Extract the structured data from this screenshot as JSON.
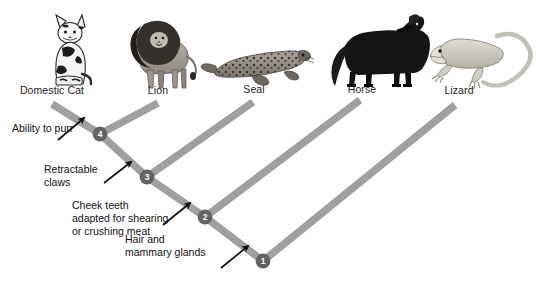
{
  "figure": {
    "type": "cladogram",
    "title": "",
    "background_color": "#ffffff",
    "branch_color": "#a0a0a0",
    "node_color": "#636363",
    "node_label_color": "#ffffff",
    "text_color": "#1a1a1a"
  },
  "taxa": [
    {
      "label": "Domestic Cat",
      "icon": "domestic-cat-illustration",
      "label_x": 10,
      "label_y": 84,
      "label_w": 84,
      "tip_x": 52,
      "tip_y": 104
    },
    {
      "label": "Lion",
      "icon": "lion-illustration",
      "label_x": 124,
      "label_y": 84,
      "label_w": 68,
      "tip_x": 158,
      "tip_y": 103
    },
    {
      "label": "Seal",
      "icon": "seal-illustration",
      "label_x": 225,
      "label_y": 83,
      "label_w": 58,
      "tip_x": 253,
      "tip_y": 102
    },
    {
      "label": "Horse",
      "icon": "horse-illustration",
      "label_x": 332,
      "label_y": 83,
      "label_w": 60,
      "tip_x": 360,
      "tip_y": 100
    },
    {
      "label": "Lizard",
      "icon": "lizard-illustration",
      "label_x": 428,
      "label_y": 84,
      "label_w": 62,
      "tip_x": 455,
      "tip_y": 105
    }
  ],
  "nodes": [
    {
      "id": "1",
      "x": 263,
      "y": 261,
      "trait": "Hair and mammary glands"
    },
    {
      "id": "2",
      "x": 205,
      "y": 217,
      "trait": "Cheek teeth adapted for shearing or crushing meat"
    },
    {
      "id": "3",
      "x": 147,
      "y": 177,
      "trait": "Retractable claws"
    },
    {
      "id": "4",
      "x": 100,
      "y": 134,
      "trait": "Ability to purr"
    }
  ],
  "branches": [
    {
      "from": "tip-domestic-cat",
      "to": "node-4"
    },
    {
      "from": "tip-lion",
      "to": "node-4"
    },
    {
      "from": "node-4",
      "to": "node-3"
    },
    {
      "from": "tip-seal",
      "to": "node-3"
    },
    {
      "from": "node-3",
      "to": "node-2"
    },
    {
      "from": "tip-horse",
      "to": "node-2"
    },
    {
      "from": "node-2",
      "to": "node-1"
    },
    {
      "from": "tip-lizard",
      "to": "node-1"
    }
  ],
  "annotations": [
    {
      "id": "ability-to-purr",
      "lines": [
        "Ability to purr"
      ],
      "x": 12,
      "y": 122,
      "align": "left",
      "arrow": {
        "x1": 58,
        "y1": 140,
        "x2": 84,
        "y2": 118
      }
    },
    {
      "id": "retractable-claws",
      "lines": [
        "Retractable",
        "claws"
      ],
      "x": 44,
      "y": 163,
      "align": "left",
      "arrow": {
        "x1": 104,
        "y1": 183,
        "x2": 131,
        "y2": 162
      }
    },
    {
      "id": "cheek-teeth",
      "lines": [
        "Cheek teeth",
        "adapted for shearing",
        "or crushing meat"
      ],
      "x": 72,
      "y": 199,
      "align": "left",
      "arrow": {
        "x1": 163,
        "y1": 225,
        "x2": 190,
        "y2": 203
      }
    },
    {
      "id": "hair-and-mammary-glands",
      "lines": [
        "Hair and",
        "mammary glands"
      ],
      "x": 125,
      "y": 233,
      "align": "left",
      "arrow": {
        "x1": 221,
        "y1": 268,
        "x2": 248,
        "y2": 246
      }
    }
  ]
}
